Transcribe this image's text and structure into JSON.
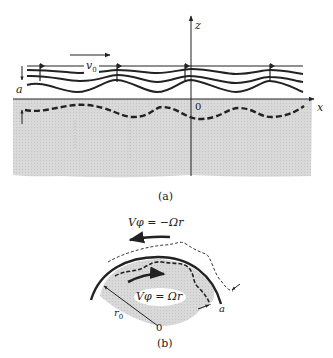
{
  "figure_a": {
    "caption": "(a)",
    "axis_x_label": "x",
    "axis_z_label": "z",
    "origin_label": "0",
    "velocity_label": "v",
    "velocity_subscript": "0",
    "amplitude_label": "a"
  },
  "figure_b": {
    "caption": "(b)",
    "outer_velocity_label": "Vφ = −Ωr",
    "inner_velocity_label": "Vφ = Ωr",
    "radius_label": "r",
    "radius_subscript": "0",
    "origin_label": "0",
    "amplitude_label": "a"
  },
  "colors": {
    "ink": "#222222",
    "shade": "#d6d6d6",
    "background": "#ffffff"
  }
}
